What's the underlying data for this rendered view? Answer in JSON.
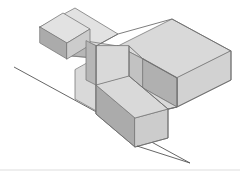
{
  "figure": {
    "type": "isometric-3d-solid",
    "background_color": "#ffffff",
    "projection": "isometric",
    "colors": {
      "top_face": "#d9d9d9",
      "top_face_highlight": "#e2e2e2",
      "left_face": "#b6b6b6",
      "left_face_dark": "#ababab",
      "right_face": "#cccccc",
      "right_face_light": "#d2d2d2",
      "inner_wall_left": "#c2c2c2",
      "inner_wall_right": "#b0b0b0",
      "edge_stroke": "#7a7a7a",
      "reference_line": "#555555",
      "footer_rule": "#cfcfcf"
    },
    "parts": [
      {
        "name": "raised-cube",
        "label": "Raised cube on left arm"
      },
      {
        "name": "left-arm",
        "label": "Left horizontal arm"
      },
      {
        "name": "center-body",
        "label": "Center body of C-shape"
      },
      {
        "name": "upper-right-arm",
        "label": "Upper right arm"
      },
      {
        "name": "lower-front-arm",
        "label": "Lower front arm"
      },
      {
        "name": "inner-notch",
        "label": "Inner notch between arms"
      }
    ],
    "reference_line": {
      "name": "ground-reference-line",
      "x1": 14,
      "y1": 67,
      "x2": 190,
      "y2": 163
    },
    "footer_rule": {
      "name": "bottom-border-rule",
      "x1": 0,
      "y1": 170,
      "x2": 240,
      "y2": 170
    }
  }
}
